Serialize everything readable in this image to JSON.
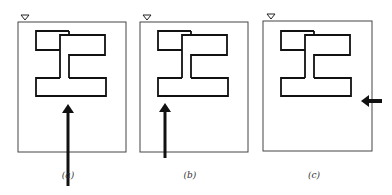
{
  "figure": {
    "panels": [
      {
        "id": "a",
        "caption": "(a)",
        "x": 18,
        "arrow": {
          "direction": "up",
          "x": 68,
          "tipY": 104,
          "tailY": 186
        }
      },
      {
        "id": "b",
        "caption": "(b)",
        "x": 140,
        "arrow": {
          "direction": "up",
          "x": 165,
          "tipY": 103,
          "tailY": 158
        }
      },
      {
        "id": "c",
        "caption": "(c)",
        "x": 263,
        "arrow": {
          "direction": "left",
          "y": 101,
          "tipX": 361,
          "tailX": 382
        }
      }
    ],
    "marker": "triangle-down",
    "stroke_color": "#111111",
    "frame_color": "#444444"
  }
}
